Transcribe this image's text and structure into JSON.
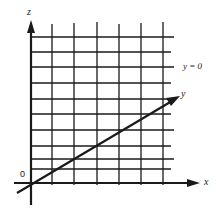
{
  "diagram": {
    "axes": {
      "z_label": "z",
      "x_label": "x",
      "y_label": "y",
      "origin_label": "0"
    },
    "plane_label": "y = 0",
    "grid": {
      "vertical_lines_x": [
        52,
        74,
        97,
        119,
        141,
        163
      ],
      "horizontal_lines_y": [
        37,
        52,
        67,
        83,
        99,
        114,
        130,
        146,
        159,
        169
      ],
      "right_edge": 174
    },
    "origin": [
      31,
      183
    ],
    "colors": {
      "line": "#1a1a1a",
      "background": "#ffffff"
    }
  }
}
